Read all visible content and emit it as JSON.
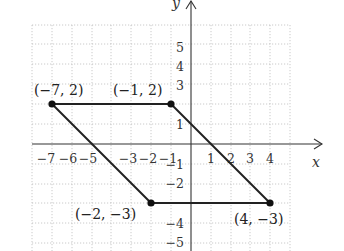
{
  "diagram": {
    "type": "coordinate-plane-parallelogram",
    "axes": {
      "x_label": "x",
      "y_label": "y",
      "x_ticks": [
        "−7",
        "−6",
        "−5",
        "−3",
        "−2",
        "−1",
        "1",
        "2",
        "3",
        "4"
      ],
      "y_ticks": [
        "5",
        "4",
        "3",
        "1",
        "−1",
        "−2",
        "−4",
        "−5"
      ]
    },
    "vertices": [
      {
        "label": "(−7, 2)",
        "x": -7,
        "y": 2
      },
      {
        "label": "(−1, 2)",
        "x": -1,
        "y": 2
      },
      {
        "label": "(4, −3)",
        "x": 4,
        "y": -3
      },
      {
        "label": "(−2, −3)",
        "x": -2,
        "y": -3
      }
    ],
    "colors": {
      "line": "#222222",
      "grid": "#bdbdbd",
      "axis": "#333333"
    }
  }
}
